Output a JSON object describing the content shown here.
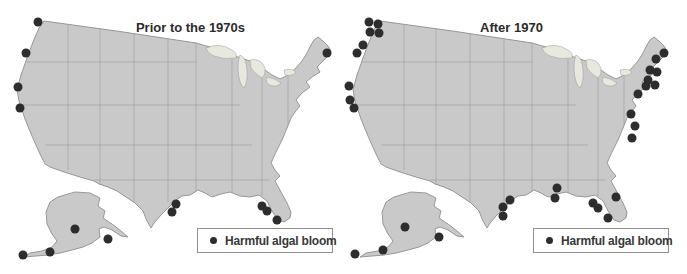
{
  "figure": {
    "type": "paired-maps"
  },
  "colors": {
    "map_fill": "#c9c9c9",
    "map_stroke": "#979797",
    "state_line": "#a0a0a0",
    "lake_fill": "#e8e8df",
    "dot_color": "#2d2d2d",
    "legend_border": "#8f8f8f",
    "title_color": "#2b2b2b",
    "text_color": "#383838"
  },
  "panels": [
    {
      "title": "Prior to the 1970s",
      "legend": {
        "icon": "filled-circle",
        "label": "Harmful algal bloom"
      },
      "dot_count": 14,
      "dots": [
        [
          38,
          22
        ],
        [
          26,
          53
        ],
        [
          18,
          87
        ],
        [
          20,
          108
        ],
        [
          327,
          53
        ],
        [
          176,
          204
        ],
        [
          172,
          212
        ],
        [
          262,
          206
        ],
        [
          267,
          211
        ],
        [
          277,
          220
        ],
        [
          75,
          229
        ],
        [
          108,
          239
        ],
        [
          50,
          252
        ],
        [
          23,
          255
        ]
      ]
    },
    {
      "title": "After 1970",
      "legend": {
        "icon": "filled-circle",
        "label": "Harmful algal bloom"
      },
      "dot_count": 33,
      "dots": [
        [
          369,
          22
        ],
        [
          378,
          24
        ],
        [
          370,
          32
        ],
        [
          379,
          33
        ],
        [
          363,
          45
        ],
        [
          357,
          53
        ],
        [
          349,
          86
        ],
        [
          350,
          100
        ],
        [
          354,
          108
        ],
        [
          664,
          53
        ],
        [
          656,
          59
        ],
        [
          650,
          70
        ],
        [
          657,
          72
        ],
        [
          648,
          80
        ],
        [
          655,
          85
        ],
        [
          646,
          86
        ],
        [
          638,
          94
        ],
        [
          631,
          114
        ],
        [
          635,
          126
        ],
        [
          632,
          138
        ],
        [
          510,
          200
        ],
        [
          503,
          207
        ],
        [
          503,
          216
        ],
        [
          557,
          188
        ],
        [
          555,
          198
        ],
        [
          593,
          203
        ],
        [
          598,
          208
        ],
        [
          608,
          218
        ],
        [
          616,
          197
        ],
        [
          405,
          227
        ],
        [
          439,
          237
        ],
        [
          383,
          250
        ],
        [
          355,
          254
        ]
      ]
    }
  ]
}
